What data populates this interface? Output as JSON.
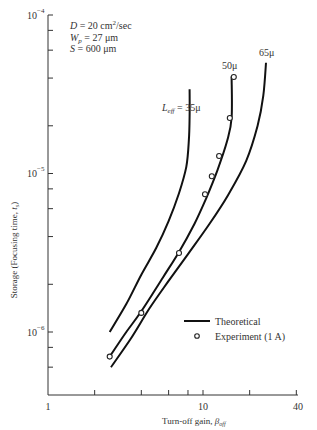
{
  "chart_data": {
    "type": "line",
    "title": "",
    "xlabel": "Turn-off gain, βoff",
    "ylabel": "Storage (Focusing time, ts)",
    "xscale": "log",
    "yscale": "log",
    "xlim": [
      1,
      40
    ],
    "ylim": [
      4e-07,
      0.0001
    ],
    "x_tick_labels": [
      "1",
      "10",
      "40"
    ],
    "x_ticks": [
      1,
      2,
      4,
      6,
      8,
      10,
      20,
      40
    ],
    "y_tick_labels": [
      "10⁻⁴",
      "10⁻⁵",
      "10⁻⁶"
    ],
    "y_ticks": [
      0.0001,
      8e-05,
      6e-05,
      4e-05,
      2e-05,
      1e-05,
      8e-06,
      6e-06,
      4e-06,
      2e-06,
      1e-06,
      8e-07,
      6e-07
    ],
    "grid": false,
    "annotations": [
      "D = 20 cm²/sec",
      "Wp = 27 μm",
      "S = 600 μm"
    ],
    "legend": {
      "position": "lower right",
      "entries": [
        {
          "label": "Theoretical",
          "marker": "line"
        },
        {
          "label": "Experiment (1 A)",
          "marker": "open-circle"
        }
      ]
    },
    "series": [
      {
        "name": "Leff = 35μ",
        "label": "Leff = 35μ",
        "kind": "theoretical",
        "x": [
          2.5,
          3.2,
          4.0,
          5.0,
          6.0,
          7.0,
          7.8,
          8.1,
          8.2,
          8.2
        ],
        "y": [
          1e-06,
          1.5e-06,
          2.3e-06,
          3.4e-06,
          5e-06,
          7.5e-06,
          1.1e-05,
          1.6e-05,
          2.3e-05,
          3.4e-05
        ]
      },
      {
        "name": "50μ",
        "label": "50μ",
        "kind": "theoretical",
        "x": [
          2.5,
          3.2,
          4.0,
          5.5,
          7.0,
          8.8,
          10.5,
          12.4,
          14.3,
          15.3,
          15.3
        ],
        "y": [
          7e-07,
          1e-06,
          1.35e-06,
          2.2e-06,
          3.2e-06,
          4.8e-06,
          7e-06,
          1.05e-05,
          1.6e-05,
          2.25e-05,
          4.1e-05
        ]
      },
      {
        "name": "65μ",
        "label": "65μ",
        "kind": "theoretical",
        "x": [
          2.55,
          3.4,
          4.5,
          6.0,
          8.0,
          11.0,
          14.5,
          19.0,
          22.5,
          24.5,
          25.5
        ],
        "y": [
          6e-07,
          9e-07,
          1.4e-06,
          2.1e-06,
          3.1e-06,
          4.8e-06,
          7.3e-06,
          1.2e-05,
          2e-05,
          3.1e-05,
          5e-05
        ]
      },
      {
        "name": "Experiment (1 A)",
        "kind": "experiment",
        "x": [
          2.5,
          4.0,
          7.0,
          10.3,
          11.4,
          12.7,
          14.9,
          15.8
        ],
        "y": [
          7e-07,
          1.32e-06,
          3.15e-06,
          7.4e-06,
          9.6e-06,
          1.29e-05,
          2.24e-05,
          4.06e-05
        ]
      }
    ]
  },
  "labels": {
    "y_axis": "Storage (Focusing time, ",
    "y_axis_sym": "t",
    "y_axis_sub": "s",
    "y_axis_end": ")",
    "x_axis": "Turn-off gain, ",
    "x_axis_sym": "β",
    "x_axis_sub": "off",
    "x_tick_1": "1",
    "x_tick_10": "10",
    "x_tick_40": "40",
    "y_tick_base": "10",
    "y_exp_4": "−4",
    "y_exp_5": "−5",
    "y_exp_6": "−6",
    "param_D_sym": "D",
    "param_D_val": " = 20 cm",
    "param_D_sup": "2",
    "param_D_end": "/sec",
    "param_W_sym": "W",
    "param_W_sub": "p",
    "param_W_val": " = 27 μm",
    "param_S_sym": "S",
    "param_S_val": " = 600 μm",
    "curve_35_prefix": "L",
    "curve_35_sub": "eff",
    "curve_35_val": " = 35μ",
    "curve_50": "50μ",
    "curve_65": "65μ",
    "legend_theoretical": "Theoretical",
    "legend_experiment": "Experiment (1 A)"
  }
}
